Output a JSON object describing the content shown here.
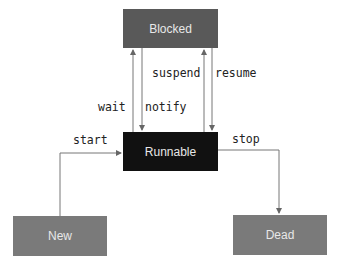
{
  "diagram": {
    "type": "state-machine",
    "states": [
      {
        "id": "blocked",
        "label": "Blocked",
        "color": "#595959"
      },
      {
        "id": "runnable",
        "label": "Runnable",
        "color": "#111111"
      },
      {
        "id": "new",
        "label": "New",
        "color": "#7a7a7a"
      },
      {
        "id": "dead",
        "label": "Dead",
        "color": "#7a7a7a"
      }
    ],
    "transitions": [
      {
        "from": "new",
        "to": "runnable",
        "label": "start"
      },
      {
        "from": "runnable",
        "to": "blocked",
        "label": "wait"
      },
      {
        "from": "blocked",
        "to": "runnable",
        "label": "notify"
      },
      {
        "from": "runnable",
        "to": "blocked",
        "label": "suspend"
      },
      {
        "from": "blocked",
        "to": "runnable",
        "label": "resume"
      },
      {
        "from": "runnable",
        "to": "dead",
        "label": "stop"
      }
    ]
  }
}
